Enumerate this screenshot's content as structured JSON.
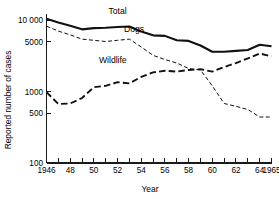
{
  "chart_data": {
    "type": "line",
    "title": "",
    "xlabel": "Year",
    "ylabel": "Reported number of cases",
    "yscale": "log",
    "ylim": [
      100,
      12000
    ],
    "xlim": [
      1946,
      1965
    ],
    "grid": false,
    "legend_position": "inline-labels",
    "y_ticks": [
      {
        "value": 10000,
        "label": "10 000"
      },
      {
        "value": 5000,
        "label": "5000"
      },
      {
        "value": 1000,
        "label": "1000"
      },
      {
        "value": 500,
        "label": "500"
      },
      {
        "value": 100,
        "label": "100"
      }
    ],
    "x_ticks": [
      {
        "value": 1946,
        "label": "1946"
      },
      {
        "value": 1947,
        "label": ""
      },
      {
        "value": 1948,
        "label": "48"
      },
      {
        "value": 1949,
        "label": ""
      },
      {
        "value": 1950,
        "label": "50"
      },
      {
        "value": 1951,
        "label": ""
      },
      {
        "value": 1952,
        "label": "52"
      },
      {
        "value": 1953,
        "label": ""
      },
      {
        "value": 1954,
        "label": "54"
      },
      {
        "value": 1955,
        "label": ""
      },
      {
        "value": 1956,
        "label": "56"
      },
      {
        "value": 1957,
        "label": ""
      },
      {
        "value": 1958,
        "label": "58"
      },
      {
        "value": 1959,
        "label": ""
      },
      {
        "value": 1960,
        "label": "60"
      },
      {
        "value": 1961,
        "label": ""
      },
      {
        "value": 1962,
        "label": "62"
      },
      {
        "value": 1963,
        "label": ""
      },
      {
        "value": 1964,
        "label": "64"
      },
      {
        "value": 1965,
        "label": "1965"
      }
    ],
    "x": [
      1946,
      1947,
      1948,
      1949,
      1950,
      1951,
      1952,
      1953,
      1954,
      1955,
      1956,
      1957,
      1958,
      1959,
      1960,
      1961,
      1962,
      1963,
      1964,
      1965
    ],
    "series": [
      {
        "name": "Total",
        "style": "solid",
        "label_x": 1952.0,
        "label_y": 13500,
        "values": [
          10400,
          9200,
          8300,
          7400,
          7700,
          7800,
          8000,
          8100,
          6900,
          6100,
          6000,
          5200,
          5100,
          4400,
          3600,
          3600,
          3700,
          3800,
          4500,
          4300
        ]
      },
      {
        "name": "Dogs",
        "style": "short-dash",
        "label_x": 1953.4,
        "label_y": 7600,
        "values": [
          8200,
          7000,
          6200,
          5400,
          5200,
          5000,
          5200,
          5400,
          4200,
          3200,
          2800,
          2500,
          2100,
          2000,
          1200,
          680,
          620,
          560,
          440,
          440
        ]
      },
      {
        "name": "Wildlife",
        "style": "long-dash",
        "label_x": 1951.6,
        "label_y": 2750,
        "values": [
          980,
          670,
          680,
          810,
          1150,
          1200,
          1350,
          1300,
          1600,
          1850,
          1950,
          1900,
          2000,
          2050,
          1900,
          2200,
          2500,
          2900,
          3400,
          3100
        ]
      }
    ],
    "annotations": [
      {
        "text": "Total",
        "series": "Total"
      },
      {
        "text": "Dogs",
        "series": "Dogs"
      },
      {
        "text": "Wildlife",
        "series": "Wildlife"
      }
    ]
  }
}
